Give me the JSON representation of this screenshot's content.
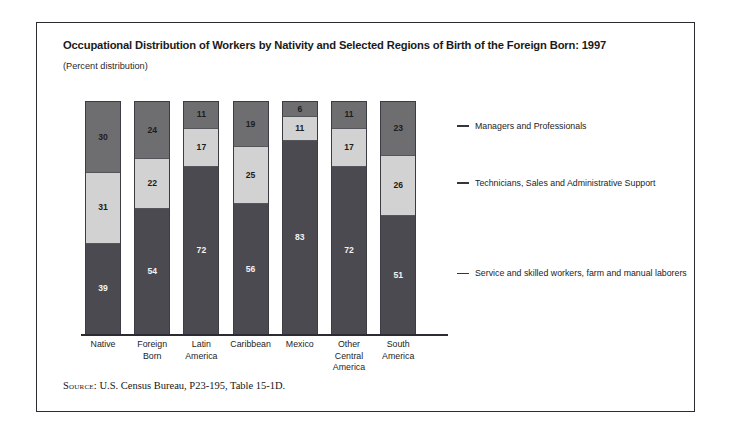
{
  "figure": {
    "title": "Occupational Distribution of Workers by Nativity and Selected Regions of Birth of the Foreign Born: 1997",
    "subtitle": "(Percent distribution)",
    "source_label": "Source:",
    "source_text": "U.S. Census Bureau, P23-195, Table 15-1D."
  },
  "chart_data": {
    "type": "bar",
    "title": "Occupational Distribution of Workers by Nativity and Selected Regions of Birth of the Foreign Born: 1997",
    "subtitle": "(Percent distribution)",
    "stacked": true,
    "orientation": "vertical",
    "xlabel": "",
    "ylabel": "",
    "ylim": [
      0,
      100
    ],
    "grid": false,
    "legend_position": "right",
    "categories": [
      "Native",
      "Foreign Born",
      "Latin America",
      "Caribbean",
      "Mexico",
      "Other Central America",
      "South America"
    ],
    "category_display": [
      [
        "Native"
      ],
      [
        "Foreign",
        "Born"
      ],
      [
        "Latin",
        "America"
      ],
      [
        "Caribbean"
      ],
      [
        "Mexico"
      ],
      [
        "Other",
        "Central",
        "America"
      ],
      [
        "South",
        "America"
      ]
    ],
    "series": [
      {
        "name": "Managers and Professionals",
        "color": "#6e6e71",
        "values": [
          30,
          24,
          11,
          19,
          6,
          11,
          23
        ]
      },
      {
        "name": "Technicians, Sales and Administrative Support",
        "color": "#d2d2d2",
        "values": [
          31,
          22,
          17,
          25,
          11,
          17,
          26
        ]
      },
      {
        "name": "Service and skilled workers, farm and manual laborers",
        "color": "#4a4a50",
        "values": [
          39,
          54,
          72,
          56,
          83,
          72,
          51
        ]
      }
    ]
  },
  "legend": [
    {
      "label": "Managers and Professionals"
    },
    {
      "label": "Technicians, Sales and Administrative Support"
    },
    {
      "label": "Service and skilled workers, farm and manual laborers"
    }
  ]
}
